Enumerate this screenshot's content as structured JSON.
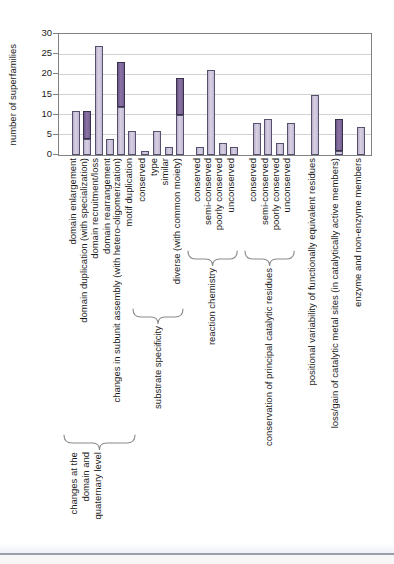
{
  "chart_data": {
    "type": "bar",
    "stacked": true,
    "title": "",
    "ylabel": "number of superfamilies",
    "xlabel": "",
    "ylim": [
      0,
      30
    ],
    "yticks": [
      0,
      5,
      10,
      15,
      20,
      25,
      30
    ],
    "grid": "horizontal",
    "legend": "none",
    "colors": {
      "light_fill": "#cbc2d8",
      "light_border": "#55506b",
      "dark_fill": "#7b6292",
      "dark_border": "#39314c",
      "gridline": "#d2d2d2",
      "plot_border": "#828282",
      "brace": "#8a8a8a",
      "text": "#1a1a1a"
    },
    "categories": [
      "domain enlargement",
      "domain duplication (with specialization)",
      "domain recruitment/loss",
      "domain rearrangement",
      "changes in subunit assembly (with hetero-oligomerization)",
      "motif duplication",
      "conserved",
      "type",
      "similar",
      "diverse (with common moiety)",
      "conserved",
      "semi-conserved",
      "poorly conserved",
      "unconserved",
      "conserved",
      "semi-conserved",
      "poorly conserved",
      "unconserved",
      "positional variability of functionally equivalent residues",
      "loss/gain of catalytic metal sites (in catalytically active members)",
      "enzyme and non-enzyme members"
    ],
    "series": [
      {
        "name": "lower segment (light purple)",
        "color": "#cbc2d8",
        "values": [
          11,
          4,
          27,
          4,
          12,
          6,
          1,
          6,
          2,
          10,
          2,
          21,
          3,
          2,
          8,
          9,
          3,
          8,
          15,
          1,
          7
        ]
      },
      {
        "name": "upper segment (dark purple)",
        "color": "#7b6292",
        "values": [
          0,
          7,
          0,
          0,
          11,
          0,
          0,
          0,
          0,
          9,
          0,
          0,
          0,
          0,
          0,
          0,
          0,
          0,
          0,
          8,
          0
        ]
      }
    ],
    "totals": [
      11,
      11,
      27,
      4,
      23,
      6,
      1,
      6,
      2,
      19,
      2,
      21,
      3,
      2,
      8,
      9,
      3,
      8,
      15,
      9,
      7
    ],
    "groups": [
      {
        "label": "changes at the domain and quaternary level",
        "label_lines": [
          "changes at the",
          "domain and",
          "quaternary level"
        ],
        "start": 0,
        "count": 6,
        "brace": true
      },
      {
        "label": "substrate specificity",
        "start": 6,
        "count": 4,
        "brace": true
      },
      {
        "label": "reaction chemistry",
        "start": 10,
        "count": 4,
        "brace": true
      },
      {
        "label": "conservation of principal catalytic residues",
        "start": 14,
        "count": 4,
        "brace": true
      },
      {
        "label": "",
        "start": 18,
        "count": 1,
        "brace": false
      },
      {
        "label": "",
        "start": 19,
        "count": 1,
        "brace": false
      },
      {
        "label": "",
        "start": 20,
        "count": 1,
        "brace": false
      }
    ]
  }
}
